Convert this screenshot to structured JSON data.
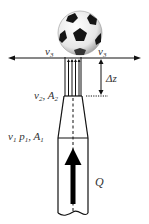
{
  "diagram": {
    "labels": {
      "v3_left": {
        "text": "v",
        "sub": "3"
      },
      "v3_right": {
        "text": "v",
        "sub": "3"
      },
      "delta_z": {
        "text": "Δz"
      },
      "v2": {
        "text": "v",
        "sub": "2"
      },
      "sep2": {
        "text": ", "
      },
      "A2": {
        "text": "A",
        "sub": "2"
      },
      "v1": {
        "text": "v",
        "sub": "1"
      },
      "p1": {
        "text": " p",
        "sub": "1"
      },
      "sep1": {
        "text": ", "
      },
      "A1": {
        "text": "A",
        "sub": "1"
      },
      "Q": {
        "text": "Q"
      }
    },
    "colors": {
      "line": "#111111",
      "ball_white": "#f2f2f2",
      "ball_patch": "#151515"
    }
  }
}
